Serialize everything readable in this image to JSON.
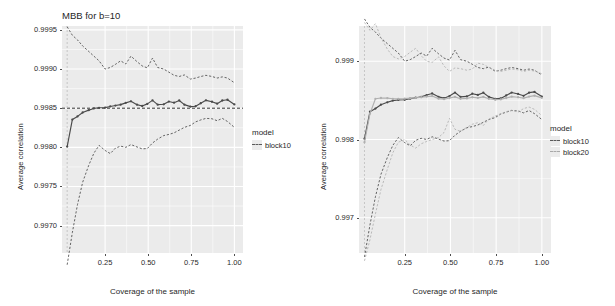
{
  "figure": {
    "background": "#ffffff",
    "panel_background": "#ebebeb",
    "grid_color": "#ffffff",
    "series_colors": {
      "block10": "#4a4a4a",
      "block20": "#b0b0b0",
      "reference_line": "#333333"
    }
  },
  "panels": [
    {
      "id": "left",
      "title": "MBB for b=10",
      "xlabel": "Coverage of the sample",
      "ylabel": "Average correlation",
      "xticks": [
        "0.25",
        "0.50",
        "0.75",
        "1.00"
      ],
      "yticks": [
        "0.9995",
        "0.9990",
        "0.9985",
        "0.9980",
        "0.9975",
        "0.9970"
      ],
      "legend": {
        "title": "model",
        "entries": [
          "block10"
        ]
      }
    },
    {
      "id": "right",
      "title": "",
      "xlabel": "Coverage of the sample",
      "ylabel": "Average correlation",
      "xticks": [
        "0.25",
        "0.50",
        "0.75",
        "1.00"
      ],
      "yticks": [
        "0.999",
        "0.998",
        "0.997"
      ],
      "legend": {
        "title": "model",
        "entries": [
          "block10",
          "block20"
        ]
      }
    }
  ],
  "chart_data": [
    {
      "type": "line",
      "panel": "left",
      "title": "MBB for b=10",
      "xlabel": "Coverage of the sample",
      "ylabel": "Average correlation",
      "xlim": [
        0.0,
        1.05
      ],
      "ylim": [
        0.99665,
        0.99955
      ],
      "xticks": [
        0.25,
        0.5,
        0.75,
        1.0
      ],
      "yticks": [
        0.997,
        0.9975,
        0.998,
        0.9985,
        0.999,
        0.9995
      ],
      "grid": true,
      "legend": {
        "title": "model",
        "position": "right",
        "entries": [
          "block10"
        ]
      },
      "annotations": [
        {
          "kind": "hline",
          "y": 0.9985,
          "style": "dashed",
          "color": "#333333"
        },
        {
          "kind": "vline",
          "x": 0.03,
          "style": "dashed",
          "color": "#bdbdbd"
        }
      ],
      "x": [
        0.03,
        0.06,
        0.09,
        0.12,
        0.155,
        0.185,
        0.215,
        0.25,
        0.28,
        0.31,
        0.34,
        0.37,
        0.4,
        0.435,
        0.465,
        0.495,
        0.525,
        0.555,
        0.59,
        0.62,
        0.65,
        0.68,
        0.71,
        0.745,
        0.775,
        0.805,
        0.835,
        0.87,
        0.9,
        0.93,
        0.96,
        1.0
      ],
      "series": [
        {
          "name": "block10",
          "role": "mean",
          "values": [
            0.99801,
            0.998355,
            0.998395,
            0.998445,
            0.998475,
            0.998497,
            0.998505,
            0.998508,
            0.998522,
            0.998534,
            0.998545,
            0.998568,
            0.998588,
            0.998545,
            0.998528,
            0.998555,
            0.9986,
            0.998545,
            0.99855,
            0.998585,
            0.99857,
            0.998598,
            0.998545,
            0.99852,
            0.998525,
            0.998563,
            0.9986,
            0.998582,
            0.998558,
            0.998598,
            0.998608,
            0.998548
          ]
        },
        {
          "name": "block10",
          "role": "upper_ci",
          "values": [
            0.99954,
            0.999432,
            0.999372,
            0.999295,
            0.999225,
            0.999165,
            0.999105,
            0.999,
            0.99902,
            0.99906,
            0.999105,
            0.999065,
            0.999165,
            0.999095,
            0.99904,
            0.999015,
            0.99914,
            0.99902,
            0.999,
            0.99896,
            0.99892,
            0.998905,
            0.998925,
            0.998872,
            0.998885,
            0.998905,
            0.99892,
            0.998905,
            0.998885,
            0.9989,
            0.998885,
            0.998825
          ]
        },
        {
          "name": "block10",
          "role": "lower_ci",
          "values": [
            0.9965,
            0.99691,
            0.99727,
            0.997555,
            0.99777,
            0.997925,
            0.998025,
            0.99796,
            0.99792,
            0.99799,
            0.998015,
            0.998,
            0.998035,
            0.998005,
            0.99798,
            0.997985,
            0.998055,
            0.998105,
            0.99815,
            0.998165,
            0.998185,
            0.99822,
            0.998255,
            0.99828,
            0.998325,
            0.99835,
            0.99837,
            0.998365,
            0.99834,
            0.99837,
            0.99833,
            0.998255
          ]
        }
      ]
    },
    {
      "type": "line",
      "panel": "right",
      "title": "",
      "xlabel": "Coverage of the sample",
      "ylabel": "Average correlation",
      "xlim": [
        0.0,
        1.05
      ],
      "ylim": [
        0.99655,
        0.99945
      ],
      "xticks": [
        0.25,
        0.5,
        0.75,
        1.0
      ],
      "yticks": [
        0.997,
        0.998,
        0.999
      ],
      "grid": true,
      "legend": {
        "title": "model",
        "position": "right",
        "entries": [
          "block10",
          "block20"
        ]
      },
      "annotations": [
        {
          "kind": "vline",
          "x": 0.03,
          "style": "dashed",
          "color": "#bdbdbd"
        }
      ],
      "x": [
        0.03,
        0.06,
        0.09,
        0.12,
        0.155,
        0.185,
        0.215,
        0.25,
        0.28,
        0.31,
        0.34,
        0.37,
        0.4,
        0.435,
        0.465,
        0.495,
        0.525,
        0.555,
        0.59,
        0.62,
        0.65,
        0.68,
        0.71,
        0.745,
        0.775,
        0.805,
        0.835,
        0.87,
        0.9,
        0.93,
        0.96,
        1.0
      ],
      "series": [
        {
          "name": "block10",
          "role": "mean",
          "values": [
            0.99801,
            0.998355,
            0.998395,
            0.998445,
            0.998475,
            0.998497,
            0.998505,
            0.998508,
            0.998522,
            0.998534,
            0.998545,
            0.998568,
            0.998588,
            0.998545,
            0.998528,
            0.998555,
            0.9986,
            0.998545,
            0.99855,
            0.998585,
            0.99857,
            0.998598,
            0.998545,
            0.99852,
            0.998525,
            0.998563,
            0.9986,
            0.998582,
            0.998558,
            0.998598,
            0.998608,
            0.998548
          ]
        },
        {
          "name": "block10",
          "role": "upper_ci",
          "values": [
            0.99954,
            0.999432,
            0.999372,
            0.999295,
            0.999225,
            0.999165,
            0.999105,
            0.999,
            0.99902,
            0.99906,
            0.999105,
            0.999065,
            0.999165,
            0.999095,
            0.99904,
            0.999015,
            0.99914,
            0.99902,
            0.999,
            0.99896,
            0.99892,
            0.998905,
            0.998925,
            0.998872,
            0.998885,
            0.998905,
            0.99892,
            0.998905,
            0.998885,
            0.9989,
            0.998885,
            0.998825
          ]
        },
        {
          "name": "block10",
          "role": "lower_ci",
          "values": [
            0.9965,
            0.99691,
            0.99727,
            0.997555,
            0.99777,
            0.997925,
            0.998025,
            0.99796,
            0.99792,
            0.99799,
            0.998015,
            0.998,
            0.998035,
            0.998005,
            0.99798,
            0.997985,
            0.998055,
            0.998105,
            0.99815,
            0.998165,
            0.998185,
            0.99822,
            0.998255,
            0.99828,
            0.998325,
            0.99835,
            0.99837,
            0.998365,
            0.99834,
            0.99837,
            0.99833,
            0.998255
          ]
        },
        {
          "name": "block20",
          "role": "mean",
          "values": [
            0.997965,
            0.99833,
            0.99852,
            0.99853,
            0.998528,
            0.99852,
            0.99852,
            0.998522,
            0.998528,
            0.998532,
            0.99854,
            0.998548,
            0.998555,
            0.998522,
            0.998515,
            0.99853,
            0.998545,
            0.99852,
            0.998525,
            0.99854,
            0.998532,
            0.998545,
            0.99852,
            0.998508,
            0.998512,
            0.99853,
            0.998548,
            0.99854,
            0.998528,
            0.998548,
            0.99856,
            0.998532
          ]
        },
        {
          "name": "block20",
          "role": "upper_ci",
          "values": [
            0.999495,
            0.999395,
            0.99948,
            0.9993,
            0.999155,
            0.99906,
            0.99903,
            0.99906,
            0.999115,
            0.999165,
            0.99907,
            0.999,
            0.998985,
            0.999055,
            0.99894,
            0.99887,
            0.998915,
            0.998905,
            0.998885,
            0.9989,
            0.998975,
            0.99896,
            0.99892,
            0.998885,
            0.99887,
            0.998885,
            0.9989,
            0.99889,
            0.99887,
            0.998885,
            0.998875,
            0.99884
          ]
        },
        {
          "name": "block20",
          "role": "lower_ci",
          "values": [
            0.99645,
            0.99672,
            0.99705,
            0.99736,
            0.99762,
            0.99783,
            0.997965,
            0.998,
            0.99793,
            0.99789,
            0.997945,
            0.997975,
            0.998,
            0.998025,
            0.99809,
            0.99827,
            0.99813,
            0.998105,
            0.998155,
            0.998195,
            0.998215,
            0.99818,
            0.99826,
            0.9983,
            0.99833,
            0.998355,
            0.998375,
            0.99835,
            0.998395,
            0.998415,
            0.998385,
            0.998305
          ]
        }
      ]
    }
  ]
}
